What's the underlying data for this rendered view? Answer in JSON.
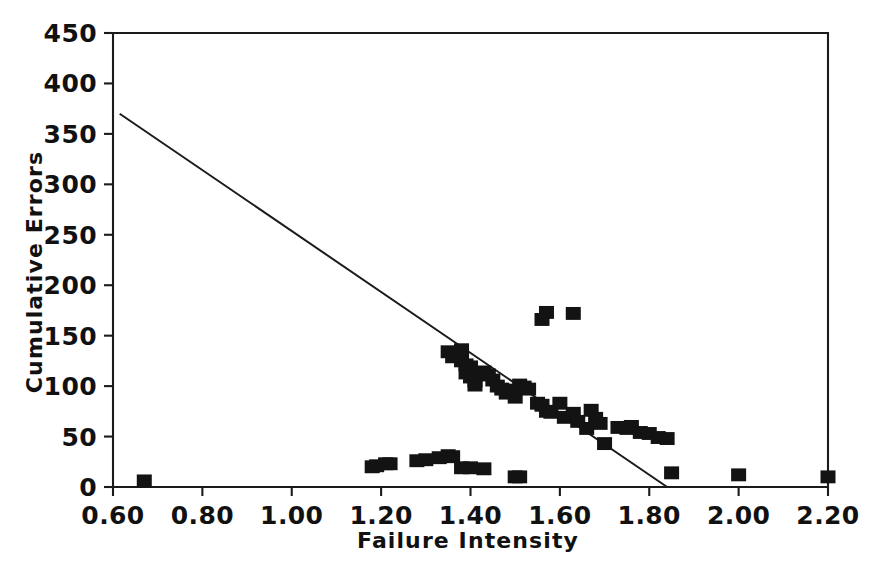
{
  "chart_data": {
    "type": "scatter",
    "title": "",
    "xlabel": "Failure Intensity",
    "ylabel": "Cumulative Errors",
    "xlim": [
      0.6,
      2.2
    ],
    "ylim": [
      0,
      450
    ],
    "grid": false,
    "legend": null,
    "xticks": [
      "0.60",
      "0.80",
      "1.00",
      "1.20",
      "1.40",
      "1.60",
      "1.80",
      "2.00",
      "2.20"
    ],
    "xtick_values": [
      0.6,
      0.8,
      1.0,
      1.2,
      1.4,
      1.6,
      1.8,
      2.0,
      2.2
    ],
    "yticks": [
      "0",
      "50",
      "100",
      "150",
      "200",
      "250",
      "300",
      "350",
      "400",
      "450"
    ],
    "ytick_values": [
      0,
      50,
      100,
      150,
      200,
      250,
      300,
      350,
      400,
      450
    ],
    "marker": "filled-square",
    "marker_color": "#131313",
    "series": [
      {
        "name": "Observations",
        "type": "scatter",
        "points": [
          [
            0.67,
            5
          ],
          [
            1.18,
            19
          ],
          [
            1.19,
            20
          ],
          [
            1.21,
            22
          ],
          [
            1.22,
            22
          ],
          [
            1.28,
            25
          ],
          [
            1.3,
            26
          ],
          [
            1.33,
            28
          ],
          [
            1.35,
            30
          ],
          [
            1.36,
            29
          ],
          [
            1.38,
            18
          ],
          [
            1.4,
            18
          ],
          [
            1.43,
            17
          ],
          [
            1.5,
            9
          ],
          [
            1.51,
            9
          ],
          [
            1.35,
            133
          ],
          [
            1.36,
            128
          ],
          [
            1.37,
            130
          ],
          [
            1.38,
            124
          ],
          [
            1.38,
            135
          ],
          [
            1.39,
            120
          ],
          [
            1.4,
            118
          ],
          [
            1.39,
            112
          ],
          [
            1.4,
            108
          ],
          [
            1.41,
            104
          ],
          [
            1.41,
            100
          ],
          [
            1.43,
            113
          ],
          [
            1.44,
            110
          ],
          [
            1.45,
            105
          ],
          [
            1.46,
            99
          ],
          [
            1.47,
            96
          ],
          [
            1.48,
            92
          ],
          [
            1.49,
            95
          ],
          [
            1.5,
            88
          ],
          [
            1.51,
            100
          ],
          [
            1.52,
            98
          ],
          [
            1.53,
            96
          ],
          [
            1.55,
            82
          ],
          [
            1.56,
            80
          ],
          [
            1.57,
            74
          ],
          [
            1.58,
            73
          ],
          [
            1.56,
            165
          ],
          [
            1.57,
            172
          ],
          [
            1.63,
            171
          ],
          [
            1.6,
            82
          ],
          [
            1.61,
            68
          ],
          [
            1.63,
            72
          ],
          [
            1.64,
            64
          ],
          [
            1.66,
            57
          ],
          [
            1.67,
            75
          ],
          [
            1.68,
            67
          ],
          [
            1.69,
            62
          ],
          [
            1.7,
            42
          ],
          [
            1.73,
            58
          ],
          [
            1.75,
            57
          ],
          [
            1.76,
            59
          ],
          [
            1.78,
            53
          ],
          [
            1.8,
            52
          ],
          [
            1.82,
            48
          ],
          [
            1.84,
            47
          ],
          [
            1.85,
            13
          ],
          [
            2.0,
            11
          ],
          [
            2.2,
            9
          ]
        ]
      },
      {
        "name": "Fitted line",
        "type": "line",
        "points": [
          [
            0.615,
            370
          ],
          [
            1.84,
            0
          ]
        ]
      }
    ]
  }
}
